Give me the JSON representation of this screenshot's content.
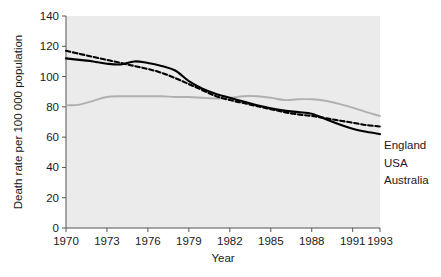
{
  "chart_data": {
    "type": "line",
    "title": "",
    "xlabel": "Year",
    "ylabel": "Death rate per 100 000 population",
    "xlim": [
      1970,
      1993
    ],
    "ylim": [
      0,
      140
    ],
    "yticks": [
      0,
      20,
      40,
      60,
      80,
      100,
      120,
      140
    ],
    "xticks": [
      1970,
      1973,
      1976,
      1979,
      1982,
      1985,
      1988,
      1991,
      1993
    ],
    "grid": false,
    "legend_position": "right-inside",
    "x": [
      1970,
      1971,
      1972,
      1973,
      1974,
      1975,
      1976,
      1977,
      1978,
      1979,
      1980,
      1981,
      1982,
      1983,
      1984,
      1985,
      1986,
      1987,
      1988,
      1989,
      1990,
      1991,
      1992,
      1993
    ],
    "series": [
      {
        "name": "England",
        "color": "#b0b0b0",
        "style": "solid",
        "values": [
          81,
          81.5,
          84,
          86.5,
          87,
          87,
          87,
          87,
          86.5,
          86.5,
          86,
          85.5,
          86,
          87,
          87,
          86,
          84.5,
          85,
          85,
          84,
          82,
          79.5,
          76.5,
          74
        ]
      },
      {
        "name": "USA",
        "color": "#000000",
        "style": "dashed",
        "values": [
          117,
          115,
          113,
          111,
          109,
          107,
          105,
          102.5,
          99,
          95,
          91,
          87,
          84.5,
          82.5,
          80.5,
          78.5,
          76.5,
          75,
          74,
          72.5,
          71,
          69.5,
          68,
          67
        ]
      },
      {
        "name": "Australia",
        "color": "#000000",
        "style": "solid",
        "values": [
          112,
          111,
          110,
          108.5,
          108,
          110,
          109,
          107,
          104,
          97,
          92,
          88.5,
          86,
          83.5,
          81,
          79,
          77.5,
          76.5,
          75.5,
          72,
          68.5,
          65.5,
          63.5,
          62
        ]
      }
    ]
  },
  "legend": {
    "entries": [
      {
        "label": "England"
      },
      {
        "label": "USA"
      },
      {
        "label": "Australia"
      }
    ]
  },
  "axes": {
    "y_label": "Death rate per 100 000 population",
    "x_label": "Year",
    "y_tick_labels": [
      "0",
      "20",
      "40",
      "60",
      "80",
      "100",
      "120",
      "140"
    ],
    "x_tick_labels": [
      "1970",
      "1973",
      "1976",
      "1979",
      "1982",
      "1985",
      "1988",
      "1991",
      "1993"
    ]
  }
}
